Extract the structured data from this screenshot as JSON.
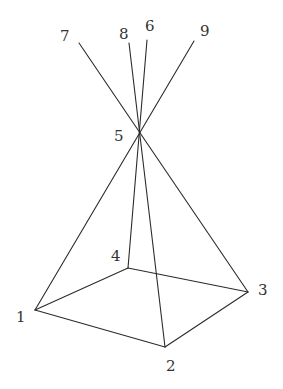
{
  "diagram": {
    "type": "pyramid-with-extended-edges",
    "colors": {
      "line": "#2b2b2b",
      "label": "#333333",
      "background": "#ffffff"
    },
    "vertices": {
      "1": {
        "label": "1",
        "x": 35,
        "y": 310,
        "lx": 16,
        "ly": 322
      },
      "2": {
        "label": "2",
        "x": 165,
        "y": 347,
        "lx": 166,
        "ly": 371
      },
      "3": {
        "label": "3",
        "x": 248,
        "y": 292,
        "lx": 258,
        "ly": 295
      },
      "4": {
        "label": "4",
        "x": 128,
        "y": 268,
        "lx": 111,
        "ly": 261
      },
      "5": {
        "label": "5",
        "x": 140,
        "y": 132,
        "lx": 114,
        "ly": 141
      },
      "6": {
        "label": "6",
        "x": 147,
        "y": 40,
        "lx": 145,
        "ly": 31
      },
      "7": {
        "label": "7",
        "x": 79,
        "y": 43,
        "lx": 60,
        "ly": 41
      },
      "8": {
        "label": "8",
        "x": 129,
        "y": 43,
        "lx": 119,
        "ly": 39
      },
      "9": {
        "label": "9",
        "x": 194,
        "y": 41,
        "lx": 200,
        "ly": 36
      }
    },
    "edges": [
      [
        "1",
        "2"
      ],
      [
        "2",
        "3"
      ],
      [
        "3",
        "4"
      ],
      [
        "4",
        "1"
      ],
      [
        "1",
        "9"
      ],
      [
        "2",
        "8"
      ],
      [
        "3",
        "7"
      ],
      [
        "4",
        "6"
      ]
    ]
  }
}
